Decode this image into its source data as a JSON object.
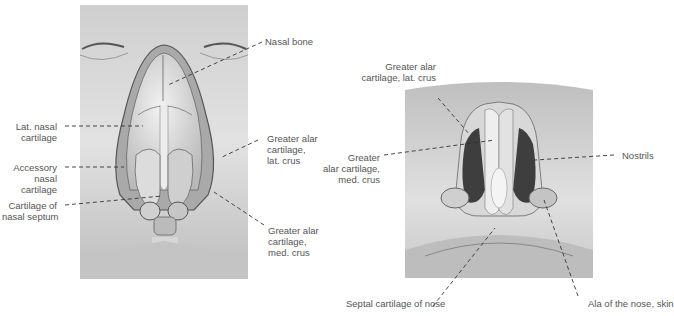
{
  "figures": [
    {
      "id": "anterior-view",
      "description": "Anterior view of nasal cartilages with skin removed",
      "labels": [
        {
          "id": "nasal-bone",
          "text": "Nasal bone"
        },
        {
          "id": "lat-nasal-cartilage",
          "text": "Lat. nasal\ncartilage"
        },
        {
          "id": "greater-alar-lat-crus",
          "text": "Greater alar\ncartilage,\nlat. crus"
        },
        {
          "id": "accessory-nasal-cartilage",
          "text": "Accessory\nnasal\ncartilage"
        },
        {
          "id": "cartilage-nasal-septum",
          "text": "Cartilage of\nnasal septum"
        },
        {
          "id": "greater-alar-med-crus",
          "text": "Greater alar\ncartilage,\nmed. crus"
        }
      ]
    },
    {
      "id": "inferior-view",
      "description": "Inferior view of the nose showing nostrils and alar cartilages",
      "labels": [
        {
          "id": "greater-alar-lat-crus-2",
          "text": "Greater alar\ncartilage, lat. crus"
        },
        {
          "id": "greater-alar-med-crus-2",
          "text": "Greater\nalar cartilage,\nmed. crus"
        },
        {
          "id": "nostrils",
          "text": "Nostrils"
        },
        {
          "id": "septal-cartilage",
          "text": "Septal cartilage of nose"
        },
        {
          "id": "ala-of-nose",
          "text": "Ala of the nose, skin"
        }
      ]
    }
  ],
  "colors": {
    "background": "#ffffff",
    "label_text": "#555555",
    "leader_line": "#333333",
    "skin_light": "#d9d9d9",
    "skin_dark": "#8a8a8a",
    "cartilage": "#e6e6e6"
  }
}
